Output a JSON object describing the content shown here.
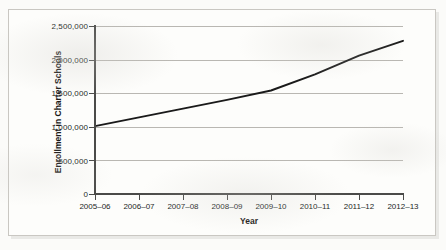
{
  "chart_data": {
    "type": "line",
    "title": "",
    "xlabel": "Year",
    "ylabel": "Enrollment in Charter Schools",
    "categories": [
      "2005–06",
      "2006–07",
      "2007–08",
      "2008–09",
      "2009–10",
      "2010–11",
      "2011–12",
      "2012–13"
    ],
    "values": [
      1010000,
      1140000,
      1270000,
      1400000,
      1540000,
      1780000,
      2060000,
      2280000
    ],
    "series": [
      {
        "name": "Enrollment in Charter Schools",
        "values": [
          1010000,
          1140000,
          1270000,
          1400000,
          1540000,
          1780000,
          2060000,
          2280000
        ]
      }
    ],
    "ylim": [
      0,
      2500000
    ],
    "ytick_values": [
      0,
      500000,
      1000000,
      1500000,
      2000000,
      2500000
    ],
    "ytick_labels": [
      "0",
      "500,000",
      "1,000,000",
      "1,500,000",
      "2,000,000",
      "2,500,000"
    ],
    "grid": true,
    "legend": false,
    "legend_position": "none",
    "line_color": "#1a1a1a",
    "grid_color": "#b9b7b2",
    "axis_color": "#4a4a48",
    "background_color": "#fdfdfb"
  }
}
